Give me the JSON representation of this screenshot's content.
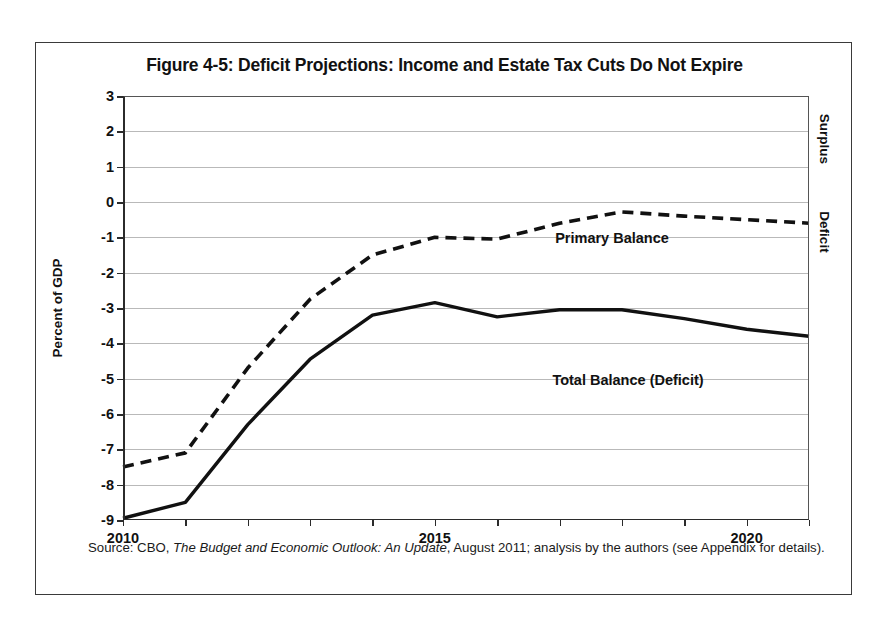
{
  "figure": {
    "title": "Figure 4-5: Deficit Projections: Income and Estate Tax Cuts Do Not Expire",
    "ylabel": "Percent of GDP",
    "side_label_top": "Surplus",
    "side_label_bottom": "Deficit",
    "source_prefix": "Source: CBO, ",
    "source_italic": "The Budget and Economic Outlook: An Update",
    "source_suffix": ", August 2011; analysis by the authors (see Appendix for details)."
  },
  "chart_data": {
    "type": "line",
    "title": "Figure 4-5: Deficit Projections: Income and Estate Tax Cuts Do Not Expire",
    "xlabel": "",
    "ylabel": "Percent of GDP",
    "xlim": [
      2010,
      2021
    ],
    "ylim": [
      -9,
      3
    ],
    "ytick_values": [
      3,
      2,
      1,
      0,
      -1,
      -2,
      -3,
      -4,
      -5,
      -6,
      -7,
      -8,
      -9
    ],
    "ytick_labels": [
      "3",
      "2",
      "1",
      "0",
      "-1",
      "-2",
      "-3",
      "-4",
      "-5",
      "-6",
      "-7",
      "-8",
      "-9"
    ],
    "xtick_values": [
      2010,
      2011,
      2012,
      2013,
      2014,
      2015,
      2016,
      2017,
      2018,
      2019,
      2020,
      2021
    ],
    "xtick_labels_shown": [
      "2010",
      "2015",
      "2020"
    ],
    "xtick_labeled_values": [
      2010,
      2015,
      2020
    ],
    "grid": "horizontal",
    "legend_position": "inline-annotation",
    "x": [
      2010,
      2011,
      2012,
      2013,
      2014,
      2015,
      2016,
      2017,
      2018,
      2019,
      2020,
      2021
    ],
    "series": [
      {
        "name": "Primary Balance",
        "style": "dashed",
        "color": "#111111",
        "values": [
          -7.5,
          -7.1,
          -4.7,
          -2.75,
          -1.5,
          -1.0,
          -1.05,
          -0.6,
          -0.28,
          -0.4,
          -0.5,
          -0.6
        ]
      },
      {
        "name": "Total Balance (Deficit)",
        "style": "solid",
        "color": "#111111",
        "values": [
          -8.95,
          -8.5,
          -6.3,
          -4.45,
          -3.2,
          -2.85,
          -3.25,
          -3.05,
          -3.05,
          -3.3,
          -3.6,
          -3.8
        ]
      }
    ],
    "annotations": [
      {
        "text": "Primary Balance",
        "x": 2017.3,
        "y": 0.35
      },
      {
        "text": "Total Balance (Deficit)",
        "x": 2017.6,
        "y": -3.7
      },
      {
        "text": "Surplus",
        "x": 2021.6,
        "y": 1.5
      },
      {
        "text": "Deficit",
        "x": 2021.6,
        "y": -1.1
      }
    ]
  }
}
